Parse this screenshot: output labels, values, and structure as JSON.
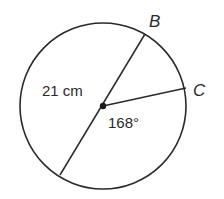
{
  "diagram": {
    "type": "circle-geometry",
    "labels": {
      "point_b": "B",
      "point_c": "C",
      "diameter_length": "21 cm",
      "central_angle": "168°"
    },
    "colors": {
      "stroke": "#2a2a2a",
      "background": "#ffffff"
    }
  }
}
